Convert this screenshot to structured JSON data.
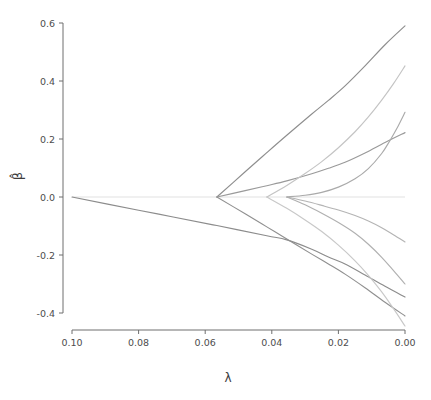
{
  "chart_data": {
    "type": "line",
    "title": "",
    "subtitle": "",
    "xlabel": "λ",
    "ylabel": "β̂",
    "xlim": [
      0.1,
      0.0
    ],
    "ylim": [
      -0.4,
      0.6
    ],
    "x_reversed": true,
    "grid": false,
    "legend": null,
    "zero_reference_line": 0.0,
    "xticks": [
      0.1,
      0.08,
      0.06,
      0.04,
      0.02,
      0.0
    ],
    "xtick_labels": [
      "0.10",
      "0.08",
      "0.06",
      "0.04",
      "0.02",
      "0.00"
    ],
    "yticks": [
      -0.4,
      -0.2,
      0.0,
      0.2,
      0.4,
      0.6
    ],
    "ytick_labels": [
      "-0.4",
      "-0.2",
      "0.0",
      "0.2",
      "0.4",
      "0.6"
    ],
    "series": [
      {
        "name": "coef-1",
        "color": "#8c8c8c",
        "entry_lambda": 0.1,
        "final_value": -0.345,
        "points": [
          [
            0.1,
            0.0
          ],
          [
            0.08,
            -0.0455
          ],
          [
            0.07,
            -0.068
          ],
          [
            0.0565,
            -0.0985
          ],
          [
            0.0415,
            -0.1335
          ],
          [
            0.0355,
            -0.148
          ],
          [
            0.028,
            -0.18
          ],
          [
            0.023,
            -0.207
          ],
          [
            0.018,
            -0.231
          ],
          [
            0.012,
            -0.269
          ],
          [
            0.006,
            -0.308
          ],
          [
            0.0,
            -0.345
          ]
        ]
      },
      {
        "name": "coef-2",
        "color": "#8e8e8e",
        "entry_lambda": 0.0565,
        "final_value": 0.59,
        "points": [
          [
            0.0565,
            0.0
          ],
          [
            0.048,
            0.087
          ],
          [
            0.0415,
            0.153
          ],
          [
            0.0355,
            0.213
          ],
          [
            0.028,
            0.286
          ],
          [
            0.023,
            0.333
          ],
          [
            0.018,
            0.383
          ],
          [
            0.012,
            0.452
          ],
          [
            0.006,
            0.525
          ],
          [
            0.0,
            0.59
          ]
        ]
      },
      {
        "name": "coef-3",
        "color": "#9a9a9a",
        "entry_lambda": 0.0565,
        "final_value": 0.222,
        "points": [
          [
            0.0565,
            0.0
          ],
          [
            0.048,
            0.022
          ],
          [
            0.0415,
            0.039
          ],
          [
            0.0355,
            0.0555
          ],
          [
            0.028,
            0.08
          ],
          [
            0.023,
            0.099
          ],
          [
            0.018,
            0.12
          ],
          [
            0.012,
            0.152
          ],
          [
            0.006,
            0.188
          ],
          [
            0.0,
            0.222
          ]
        ]
      },
      {
        "name": "coef-4",
        "color": "#909090",
        "entry_lambda": 0.0565,
        "final_value": -0.41,
        "points": [
          [
            0.0565,
            0.0
          ],
          [
            0.048,
            -0.058
          ],
          [
            0.0415,
            -0.103
          ],
          [
            0.0355,
            -0.145
          ],
          [
            0.028,
            -0.197
          ],
          [
            0.023,
            -0.231
          ],
          [
            0.018,
            -0.266
          ],
          [
            0.012,
            -0.313
          ],
          [
            0.006,
            -0.363
          ],
          [
            0.0,
            -0.41
          ]
        ]
      },
      {
        "name": "coef-5",
        "color": "#c4c4c4",
        "entry_lambda": 0.0415,
        "final_value": 0.452,
        "points": [
          [
            0.0415,
            0.0
          ],
          [
            0.0355,
            0.04
          ],
          [
            0.03,
            0.081
          ],
          [
            0.025,
            0.122
          ],
          [
            0.02,
            0.17
          ],
          [
            0.015,
            0.225
          ],
          [
            0.011,
            0.276
          ],
          [
            0.007,
            0.334
          ],
          [
            0.0035,
            0.39
          ],
          [
            0.0,
            0.452
          ]
        ]
      },
      {
        "name": "coef-6",
        "color": "#c8c8c8",
        "entry_lambda": 0.0415,
        "final_value": -0.445,
        "points": [
          [
            0.0415,
            0.0
          ],
          [
            0.0355,
            -0.039
          ],
          [
            0.03,
            -0.079
          ],
          [
            0.025,
            -0.119
          ],
          [
            0.02,
            -0.166
          ],
          [
            0.015,
            -0.22
          ],
          [
            0.011,
            -0.27
          ],
          [
            0.007,
            -0.327
          ],
          [
            0.0035,
            -0.384
          ],
          [
            0.0,
            -0.445
          ]
        ]
      },
      {
        "name": "coef-7",
        "color": "#b4b4b4",
        "entry_lambda": 0.0355,
        "final_value": -0.155,
        "points": [
          [
            0.0355,
            0.0
          ],
          [
            0.03,
            -0.014
          ],
          [
            0.025,
            -0.029
          ],
          [
            0.02,
            -0.045
          ],
          [
            0.015,
            -0.064
          ],
          [
            0.011,
            -0.083
          ],
          [
            0.007,
            -0.106
          ],
          [
            0.0035,
            -0.13
          ],
          [
            0.0,
            -0.155
          ]
        ]
      },
      {
        "name": "coef-8",
        "color": "#b0b0b0",
        "entry_lambda": 0.0355,
        "final_value": -0.3,
        "points": [
          [
            0.0355,
            0.0
          ],
          [
            0.03,
            -0.027
          ],
          [
            0.025,
            -0.056
          ],
          [
            0.02,
            -0.088
          ],
          [
            0.015,
            -0.125
          ],
          [
            0.011,
            -0.163
          ],
          [
            0.007,
            -0.208
          ],
          [
            0.0035,
            -0.253
          ],
          [
            0.0,
            -0.3
          ]
        ]
      },
      {
        "name": "coef-9",
        "color": "#aaaaaa",
        "entry_lambda": 0.0355,
        "final_value": 0.292,
        "points": [
          [
            0.0355,
            0.0
          ],
          [
            0.03,
            0.006
          ],
          [
            0.025,
            0.016
          ],
          [
            0.02,
            0.034
          ],
          [
            0.015,
            0.063
          ],
          [
            0.011,
            0.098
          ],
          [
            0.007,
            0.15
          ],
          [
            0.0045,
            0.195
          ],
          [
            0.0025,
            0.235
          ],
          [
            0.0,
            0.292
          ]
        ]
      }
    ]
  },
  "axes": {
    "y_axis_label": "β̂",
    "x_axis_label": "λ"
  },
  "style": {
    "axis_color": "#6e6e6e",
    "tick_label_color": "#4d4d4d",
    "zero_line_color": "#e2e2e2",
    "background": "#ffffff"
  }
}
